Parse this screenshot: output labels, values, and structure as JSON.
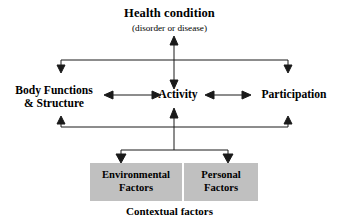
{
  "diagram": {
    "title": "Health condition",
    "subtitle": "(disorder or disease)",
    "caption": "Contextual factors",
    "nodes": {
      "health_condition": "Health condition",
      "health_condition_note": "(disorder or disease)",
      "body_functions": "Body Functions\n& Structure",
      "body_functions_line1": "Body Functions",
      "body_functions_line2": "& Structure",
      "activity": "Activity",
      "participation": "Participation",
      "environmental_factors_line1": "Environmental",
      "environmental_factors_line2": "Factors",
      "personal_factors_line1": "Personal",
      "personal_factors_line2": "Factors"
    },
    "colors": {
      "background": "#ffffff",
      "text": "#000000",
      "box_fill": "#c0c0c0",
      "line": "#1a1a1a"
    },
    "connectors": [
      {
        "name": "health-to-activity",
        "type": "double-vertical"
      },
      {
        "name": "top-bracket-left",
        "type": "down-arrow"
      },
      {
        "name": "top-bracket-right",
        "type": "down-arrow"
      },
      {
        "name": "body-functions-to-activity",
        "type": "double-horizontal"
      },
      {
        "name": "activity-to-participation",
        "type": "double-horizontal"
      },
      {
        "name": "bottom-bracket-left",
        "type": "up-arrow"
      },
      {
        "name": "bottom-bracket-right",
        "type": "up-arrow"
      },
      {
        "name": "contextual-to-activity",
        "type": "up-arrow"
      },
      {
        "name": "contextual-to-environmental",
        "type": "down-arrow"
      },
      {
        "name": "contextual-to-personal",
        "type": "down-arrow"
      }
    ]
  }
}
